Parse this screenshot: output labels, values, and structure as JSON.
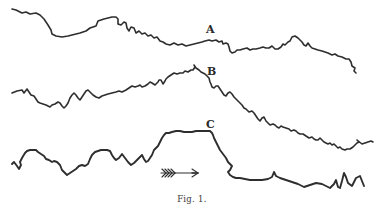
{
  "figure": {
    "caption": "Fig. 1.",
    "ink_color": "#2e2e2e",
    "curves": [
      {
        "label": "A",
        "label_pos": [
          206,
          24
        ],
        "points": "12,9 16,10 22,13 26,12 30,14 36,13 40,15 44,19 48,25 51,30 52,34 56,36 62,37 68,36 72,35 76,34 80,33 86,31 90,28 96,26 98,21 104,19 108,18 112,17 116,17 118,19 118,24 121,25 124,22 126,23 127,28 129,31 131,27 134,28 136,33 139,31 142,34 145,33 148,36 151,35 154,38 157,37 160,41 163,42 166,44 170,45 174,43 178,45 182,44 186,46 190,45 194,44 198,43 202,42 205,41 209,40 212,41 216,40 219,42 222,41 223,44 226,43 228,44 229,47 230,51 232,53 235,52 237,50 240,50 243,49 247,48 250,50 253,49 256,49 260,48 263,47 266,48 269,48 272,46 275,49 278,49 281,47 283,44 285,45 288,42 290,41 292,37 295,36 298,38 300,40 302,42 304,45 306,46 308,43 310,46 312,48 315,49 318,50 322,51 325,52 328,53 332,55 335,54 338,56 342,57 346,59 349,59 351,62 352,66 355,68 354,71 356,73"
      },
      {
        "label": "B",
        "label_pos": [
          207,
          66
        ],
        "points": "12,93 17,91 22,90 24,93 27,89 29,92 31,95 34,96 36,99 38,102 40,103 43,104 46,105 48,106 50,107 52,105 55,104 58,102 60,103 62,106 64,108 66,106 68,103 70,98 72,95 74,93 76,95 78,98 80,100 82,97 84,94 86,91 88,90 90,92 93,95 96,97 99,98 102,96 105,95 108,94 112,93 116,92 119,91 122,92 126,90 129,88 132,86 135,87 138,86 140,85 142,87 145,86 148,84 150,82 152,83 155,85 158,82 159,80 161,80 163,84 165,81 166,79 168,77 171,75 174,73 177,74 180,73 183,73 185,71 188,72 191,70 193,70 195,67 194,65 196,68 199,70 201,72 203,73 205,74 207,76 209,78 210,82 211,84 212,87 214,88 216,86 218,86 220,89 222,92 224,95 226,96 228,93 230,92 232,94 234,97 236,99 238,101 240,103 242,105 244,108 246,109 249,112 252,111 254,113 256,116 258,119 260,121 262,118 264,117 266,121 268,123 270,125 273,124 275,125 277,127 279,128 281,126 283,127 286,128 289,129 291,131 294,130 296,131 298,133 300,134 303,134 306,136 309,138 312,137 314,139 316,140 318,140 320,138 322,140 324,142 326,143 328,144 330,143 332,145 334,144 336,146 338,148 340,147 342,149 345,150 347,149 350,149 353,147 355,145 357,143 359,142 357,140 362,144 371,141 373,142"
      },
      {
        "label": "C",
        "label_pos": [
          206,
          119
        ],
        "points": "12,164 14,162 17,166 19,169 21,165 20,162 22,158 25,153 27,151 30,150 33,150 36,150 38,152 41,154 44,156 46,159 49,160 52,162 54,161 57,162 60,165 62,170 65,173 67,175 70,173 73,171 76,169 79,166 82,165 85,166 88,164 90,159 92,155 95,152 98,151 101,150 104,150 107,150 110,151 112,155 114,158 116,160 119,158 122,154 125,158 128,162 131,165 134,163 137,160 140,157 142,155 144,159 146,162 148,161 150,158 152,155 154,150 156,148 158,146 160,142 162,138 164,135 166,133 169,133 172,132 176,131 180,131 184,132 188,132 192,132 196,131 200,131 204,131 207,131 210,131 212,133 213,135 214,138 216,142 218,146 220,150 223,154 226,158 228,162 230,164 232,166 230,170 228,172 230,175 233,177 236,178 240,178 245,179 250,180 256,180 262,180 268,179 272,177 274,172 276,176 280,178 286,180 292,182 298,184 304,187 310,185 316,183 322,184 326,186 330,188 334,184 336,180 338,187 340,188 342,181 344,173 346,177 348,183 352,186 356,178 360,176 362,181 364,186"
      }
    ],
    "arrow": {
      "direction": "right",
      "shaft": [
        161,
        173,
        198,
        173
      ],
      "icon": "feathered-arrow"
    }
  }
}
